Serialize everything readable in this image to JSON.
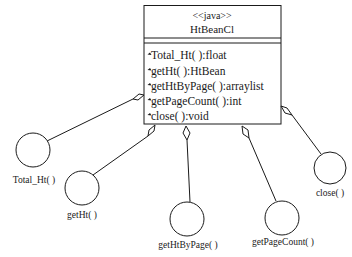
{
  "class_box": {
    "stereotype": "<<java>>",
    "name": "HtBeanCl",
    "methods": [
      "Total_Ht( ):float",
      "getHt( ):HtBean",
      "getHtByPage( ):arraylist",
      "getPageCount( ):int",
      "close( ):void"
    ],
    "method_icon": "operation-icon"
  },
  "interfaces": [
    {
      "label": "Total_Ht( )"
    },
    {
      "label": "getHt( )"
    },
    {
      "label": "getHtByPage( )"
    },
    {
      "label": "getPageCount( )"
    },
    {
      "label": "close( )"
    }
  ],
  "colors": {
    "stroke": "#1a1a1a",
    "background": "#ffffff"
  }
}
